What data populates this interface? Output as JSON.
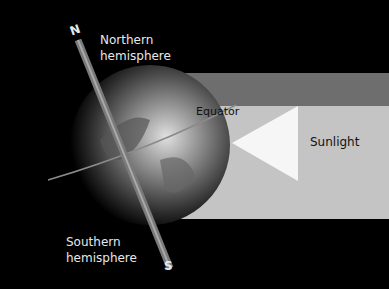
{
  "diagram": {
    "labels": {
      "north_pole": "N",
      "south_pole": "S",
      "northern": "Northern\nhemisphere",
      "southern": "Southern\nhemisphere",
      "equator": "Equator",
      "sunlight": "Sunlight"
    },
    "colors": {
      "background": "#000000",
      "sunlight_band": "#c4c4c4",
      "shadow_band": "#6e6e6e",
      "arrow": "#f6f6f6",
      "axis": "#7a7a7a"
    }
  }
}
